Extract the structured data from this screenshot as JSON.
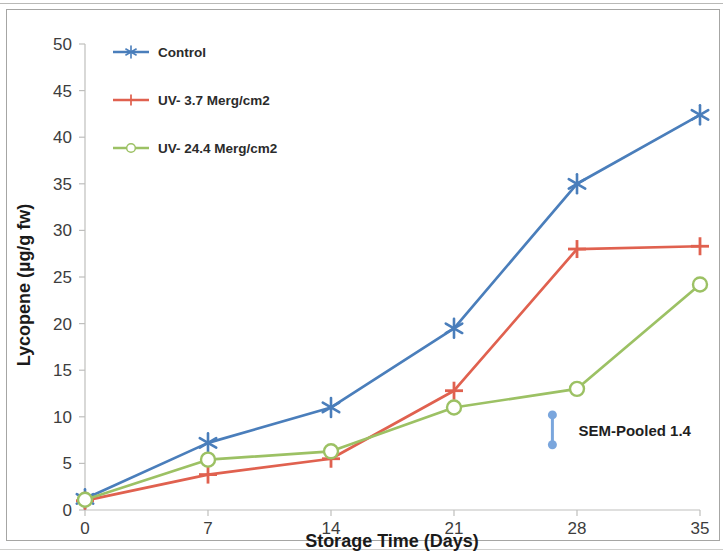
{
  "chart_data": {
    "type": "line",
    "title": "",
    "xlabel": "Storage Time (Days)",
    "ylabel": "Lycopene (µg/g fw)",
    "x": [
      0,
      7,
      14,
      21,
      28,
      35
    ],
    "xticklabels": [
      "0",
      "7",
      "14",
      "21",
      "28",
      "35"
    ],
    "yticklabels": [
      "0",
      "5",
      "10",
      "15",
      "20",
      "25",
      "30",
      "35",
      "40",
      "45",
      "50"
    ],
    "xlim": [
      0,
      35
    ],
    "ylim": [
      0,
      50
    ],
    "grid": false,
    "legend_position": "upper-left-inside",
    "series": [
      {
        "name": "Control",
        "color": "#4a7ebb",
        "marker": "asterisk",
        "values": [
          1.2,
          7.2,
          11.0,
          19.5,
          35.0,
          42.4
        ]
      },
      {
        "name": "UV- 3.7 Merg/cm2",
        "color": "#e0614f",
        "marker": "plus",
        "values": [
          1.0,
          3.8,
          5.5,
          12.8,
          28.0,
          28.3
        ]
      },
      {
        "name": "UV- 24.4 Merg/cm2",
        "color": "#9cc164",
        "marker": "circle-open",
        "values": [
          1.1,
          5.4,
          6.3,
          11.0,
          13.0,
          24.2
        ]
      }
    ],
    "annotations": [
      {
        "name": "sem-pooled-error-bar",
        "label": "SEM-Pooled 1.4",
        "x": 26.6,
        "y_top": 10.2,
        "y_bottom": 7.0,
        "color": "#7aa6dd"
      }
    ]
  },
  "axes": {
    "y_ticks": [
      "50",
      "45",
      "40",
      "35",
      "30",
      "25",
      "20",
      "15",
      "10",
      "5",
      "0"
    ],
    "x_ticks": [
      "0",
      "7",
      "14",
      "21",
      "28",
      "35"
    ],
    "y_title": "Lycopene (µg/g fw)",
    "x_title": "Storage Time (Days)"
  },
  "legend": {
    "items": [
      {
        "label": "Control",
        "color": "#4a7ebb"
      },
      {
        "label": "UV- 3.7 Merg/cm2",
        "color": "#e0614f"
      },
      {
        "label": "UV- 24.4 Merg/cm2",
        "color": "#9cc164"
      }
    ]
  },
  "annotation": {
    "sem_label": "SEM-Pooled 1.4"
  }
}
